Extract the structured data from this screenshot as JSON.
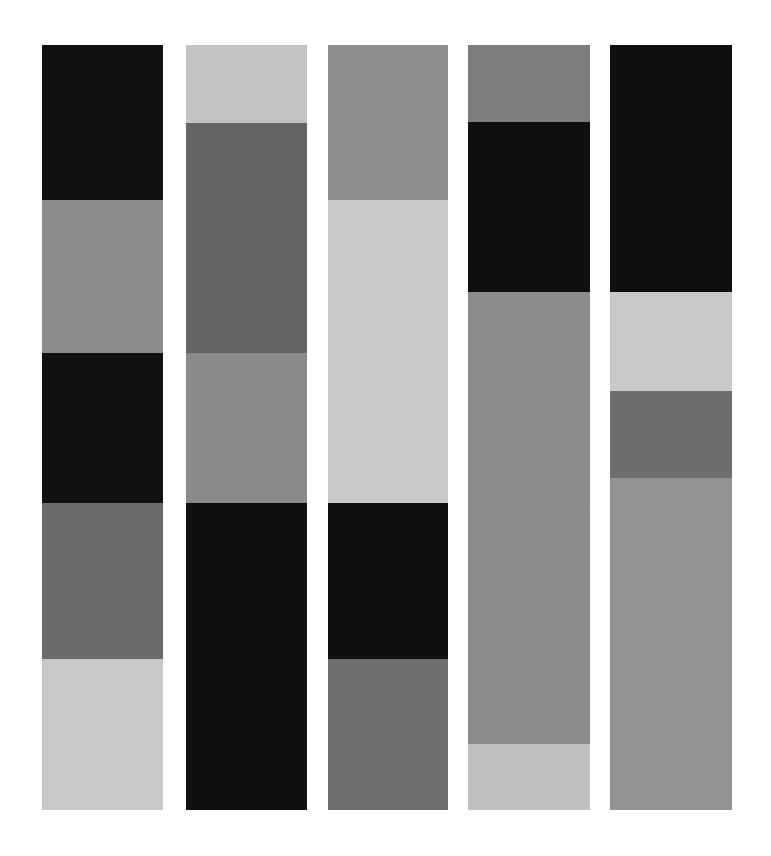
{
  "image": {
    "title": "Vertical grayscale color-bar composition",
    "background_color": "#ffffff",
    "width": 771,
    "height": 856,
    "column_count": 5,
    "segment_count_total": 23
  },
  "chart_data": {
    "type": "bar",
    "subtitle": "",
    "xlabel": "",
    "ylabel": "",
    "grid": false,
    "legend": "none",
    "orientation": "vertical-stacked",
    "categories": [
      "Bar 1",
      "Bar 2",
      "Bar 3",
      "Bar 4",
      "Bar 5"
    ],
    "palette": {
      "black": "#0d0d0d",
      "dark_gray": "#5a5a5a",
      "medium_gray": "#8a8a8a",
      "mid_gray": "#7e7e7e",
      "light_gray": "#c8c8c8",
      "pale_gray": "#d2d2d2"
    },
    "series": [
      {
        "name": "Bar 1",
        "x": 42,
        "width": 121,
        "segments": [
          {
            "label": "1-a",
            "color": "#0d0d0d",
            "top": 45,
            "height": 155
          },
          {
            "label": "1-b",
            "color": "#8d8d8d",
            "top": 200,
            "height": 153
          },
          {
            "label": "1-c",
            "color": "#0d0d0d",
            "top": 353,
            "height": 150
          },
          {
            "label": "1-d",
            "color": "#6b6b6b",
            "top": 503,
            "height": 156
          },
          {
            "label": "1-e",
            "color": "#cbcbcb",
            "top": 659,
            "height": 151
          }
        ]
      },
      {
        "name": "Bar 2",
        "x": 186,
        "width": 121,
        "segments": [
          {
            "label": "2-a",
            "color": "#c6c6c6",
            "top": 45,
            "height": 78
          },
          {
            "label": "2-b",
            "color": "#636363",
            "top": 123,
            "height": 230
          },
          {
            "label": "2-c",
            "color": "#8b8b8b",
            "top": 353,
            "height": 150
          },
          {
            "label": "2-d",
            "color": "#0b0b0b",
            "top": 503,
            "height": 307
          }
        ]
      },
      {
        "name": "Bar 3",
        "x": 328,
        "width": 120,
        "segments": [
          {
            "label": "3-a",
            "color": "#8e8e8e",
            "top": 45,
            "height": 155
          },
          {
            "label": "3-b",
            "color": "#cdcdcd",
            "top": 200,
            "height": 303
          },
          {
            "label": "3-c",
            "color": "#0b0b0b",
            "top": 503,
            "height": 156
          },
          {
            "label": "3-d",
            "color": "#6e6e6e",
            "top": 659,
            "height": 151
          }
        ]
      },
      {
        "name": "Bar 4",
        "x": 468,
        "width": 122,
        "segments": [
          {
            "label": "4-a",
            "color": "#7d7d7d",
            "top": 45,
            "height": 77
          },
          {
            "label": "4-b",
            "color": "#0b0b0b",
            "top": 122,
            "height": 170
          },
          {
            "label": "4-c",
            "color": "#8c8c8c",
            "top": 292,
            "height": 452
          },
          {
            "label": "4-d",
            "color": "#c2c2c2",
            "top": 744,
            "height": 66
          }
        ]
      },
      {
        "name": "Bar 5",
        "x": 610,
        "width": 122,
        "segments": [
          {
            "label": "5-a",
            "color": "#0b0b0b",
            "top": 45,
            "height": 247
          },
          {
            "label": "5-b",
            "color": "#cbcbcb",
            "top": 292,
            "height": 99
          },
          {
            "label": "5-c",
            "color": "#6d6d6d",
            "top": 391,
            "height": 87
          },
          {
            "label": "5-d",
            "color": "#949494",
            "top": 478,
            "height": 332
          }
        ]
      }
    ]
  }
}
